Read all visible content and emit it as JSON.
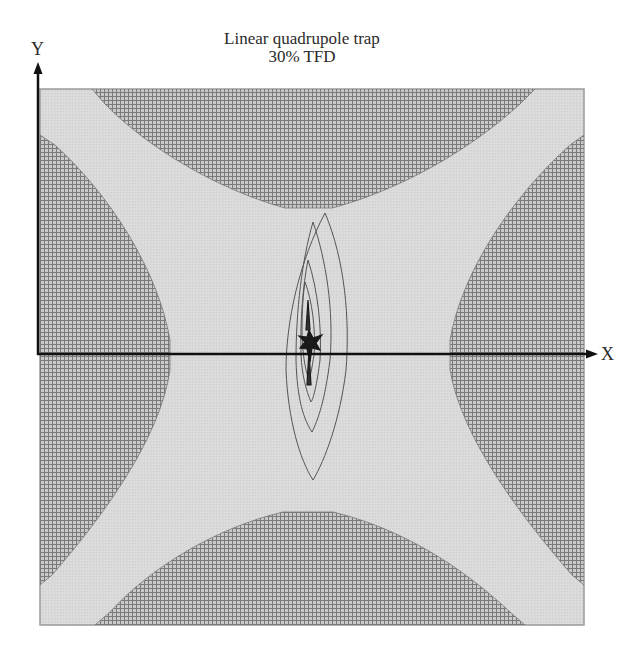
{
  "figure": {
    "title_line1": "Linear quadrupole trap",
    "title_line2": "30% TFD",
    "x_axis_label": "X",
    "y_axis_label": "Y"
  },
  "colors": {
    "background": "#ffffff",
    "field_region": "#d9d9d9",
    "electrode_fill": "#c6c6c6",
    "electrode_grid": "#7a7a7a",
    "frame": "#9a9a9a",
    "axis": "#111111",
    "trajectory": "#555555",
    "trajectory_core": "#1a1a1a"
  },
  "electrodes": [
    {
      "name": "top",
      "polarity": "pole"
    },
    {
      "name": "bottom",
      "polarity": "pole"
    },
    {
      "name": "left",
      "polarity": "pole"
    },
    {
      "name": "right",
      "polarity": "pole"
    }
  ],
  "trajectory": {
    "description": "Ion trajectory contours centered near origin, elongated along Y"
  }
}
